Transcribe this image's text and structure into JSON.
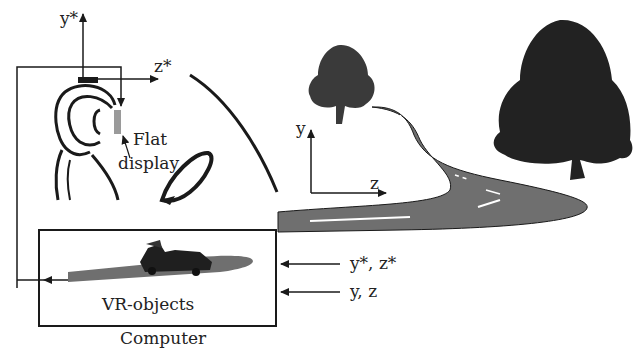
{
  "diagram": {
    "head_axes": {
      "y_label": "y*",
      "z_label": "z*"
    },
    "world_axes": {
      "y_label": "y",
      "z_label": "z"
    },
    "display_label": {
      "line1": "Flat",
      "line2": "display"
    },
    "computer_box": {
      "inner_label": "VR-objects",
      "caption": "Computer"
    },
    "inputs": [
      {
        "label": "y*, z*"
      },
      {
        "label": "y, z"
      }
    ],
    "colors": {
      "stroke": "#1a1a1a",
      "road": "#6f6f6f",
      "tree": "#2a2a2a",
      "display": "#9a9a9a"
    }
  }
}
